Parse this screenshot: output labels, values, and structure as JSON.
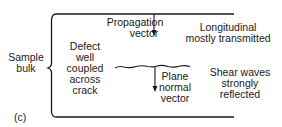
{
  "diagram": {
    "panel_label": "(c)",
    "side_label": {
      "line1": "Sample",
      "line2": "bulk"
    },
    "propagation": {
      "line1": "Propagation",
      "line2": "vector"
    },
    "longitudinal": {
      "line1": "Longitudinal",
      "line2": "mostly transmitted"
    },
    "defect": {
      "line1": "Defect",
      "line2": "well",
      "line3": "coupled",
      "line4": "across",
      "line5": "crack"
    },
    "plane_normal": {
      "line1": "Plane",
      "line2": "normal",
      "line3": "vector"
    },
    "shear": {
      "line1": "Shear waves",
      "line2": "strongly",
      "line3": "reflected"
    },
    "colors": {
      "ink": "#1a1a1a",
      "background": "#ffffff"
    }
  }
}
